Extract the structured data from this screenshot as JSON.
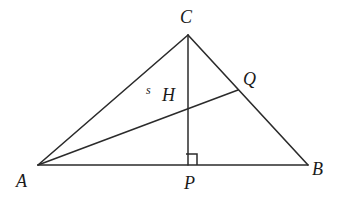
{
  "figure": {
    "kind": "geometry-diagram",
    "width": 338,
    "height": 204,
    "background_color": "#ffffff",
    "stroke_color": "#2b2b2b",
    "stroke_width": 1.5
  },
  "points": {
    "A": {
      "label": "A",
      "x": 38,
      "y": 165,
      "label_x": 16,
      "label_y": 172
    },
    "B": {
      "label": "B",
      "x": 308,
      "y": 165,
      "label_x": 312,
      "label_y": 160
    },
    "C": {
      "label": "C",
      "x": 188,
      "y": 35,
      "label_x": 180,
      "label_y": 8
    },
    "P": {
      "label": "P",
      "x": 188,
      "y": 165,
      "label_x": 184,
      "label_y": 174
    },
    "Q": {
      "label": "Q",
      "x": 238,
      "y": 90,
      "label_x": 243,
      "label_y": 70
    },
    "H": {
      "label": "H",
      "x": 188,
      "y": 108,
      "label_x": 162,
      "label_y": 86
    }
  },
  "segment_labels": {
    "s": {
      "label": "s",
      "x": 146,
      "y": 84
    }
  },
  "segments": [
    {
      "name": "side-AB",
      "from": "A",
      "to": "B"
    },
    {
      "name": "side-AC",
      "from": "A",
      "to": "C"
    },
    {
      "name": "side-CB",
      "from": "C",
      "to": "B"
    },
    {
      "name": "altitude-CP",
      "from": "C",
      "to": "P"
    },
    {
      "name": "cevian-AQ",
      "from": "A",
      "to": "Q"
    }
  ],
  "right_angle": {
    "at": "P",
    "size": 11,
    "x": 186,
    "y": 154
  }
}
